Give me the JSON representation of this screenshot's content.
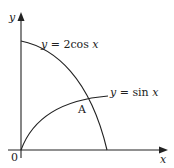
{
  "diagram": {
    "axes": {
      "x_label": "x",
      "y_label": "y",
      "origin_label": "0"
    },
    "curves": [
      {
        "name": "cos-curve",
        "label_var": "y",
        "label_eq": " = 2cos ",
        "label_arg": "x"
      },
      {
        "name": "sin-curve",
        "label_var": "y",
        "label_eq": " = sin ",
        "label_arg": "x"
      }
    ],
    "intersection_label": "A",
    "colors": {
      "stroke": "#222222",
      "background": "#ffffff"
    }
  }
}
